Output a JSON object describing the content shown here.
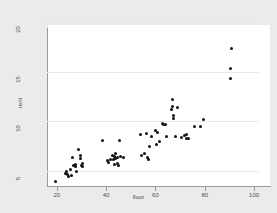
{
  "chart_data": {
    "type": "scatter",
    "title": "",
    "xlabel": "floor",
    "ylabel": "rent",
    "xlim": [
      12,
      102
    ],
    "ylim": [
      4.2,
      20.4
    ],
    "xticks": [
      20,
      40,
      60,
      80,
      100
    ],
    "yticks": [
      5,
      10,
      15,
      20
    ],
    "grid": "horizontal",
    "legend": "none",
    "marker": {
      "shape": "circle",
      "color": "#111111",
      "size": 3
    },
    "background": {
      "graph_region": "#ebebeb",
      "plot_region": "#ffffff"
    },
    "points": [
      {
        "x": 15,
        "y": 4.7
      },
      {
        "x": 19,
        "y": 5.5
      },
      {
        "x": 19.5,
        "y": 5.7
      },
      {
        "x": 20,
        "y": 5.4
      },
      {
        "x": 20.5,
        "y": 5.2
      },
      {
        "x": 21,
        "y": 5.9
      },
      {
        "x": 21.5,
        "y": 5.3
      },
      {
        "x": 22,
        "y": 7.1
      },
      {
        "x": 22.5,
        "y": 6.3
      },
      {
        "x": 23,
        "y": 6.4
      },
      {
        "x": 23.2,
        "y": 6.2
      },
      {
        "x": 23.5,
        "y": 5.7
      },
      {
        "x": 24.5,
        "y": 7.9
      },
      {
        "x": 25,
        "y": 7.3
      },
      {
        "x": 25.2,
        "y": 7.0
      },
      {
        "x": 25.5,
        "y": 6.3
      },
      {
        "x": 25.8,
        "y": 6.2
      },
      {
        "x": 26,
        "y": 6.5
      },
      {
        "x": 34,
        "y": 8.8
      },
      {
        "x": 36,
        "y": 6.8
      },
      {
        "x": 36.5,
        "y": 6.6
      },
      {
        "x": 37.5,
        "y": 6.9
      },
      {
        "x": 38,
        "y": 7.3
      },
      {
        "x": 38.5,
        "y": 6.9
      },
      {
        "x": 38.8,
        "y": 6.4
      },
      {
        "x": 39,
        "y": 7.2
      },
      {
        "x": 39.3,
        "y": 7.0
      },
      {
        "x": 39.5,
        "y": 7.5
      },
      {
        "x": 40,
        "y": 7.1
      },
      {
        "x": 40.2,
        "y": 6.5
      },
      {
        "x": 40.5,
        "y": 6.3
      },
      {
        "x": 41,
        "y": 8.8
      },
      {
        "x": 41.5,
        "y": 7.2
      },
      {
        "x": 42.5,
        "y": 7.1
      },
      {
        "x": 49.5,
        "y": 9.4
      },
      {
        "x": 50,
        "y": 7.3
      },
      {
        "x": 51,
        "y": 7.5
      },
      {
        "x": 52,
        "y": 9.5
      },
      {
        "x": 52.5,
        "y": 7.1
      },
      {
        "x": 52.8,
        "y": 6.9
      },
      {
        "x": 53,
        "y": 8.2
      },
      {
        "x": 54,
        "y": 9.2
      },
      {
        "x": 55.5,
        "y": 9.8
      },
      {
        "x": 56,
        "y": 8.4
      },
      {
        "x": 56.5,
        "y": 9.6
      },
      {
        "x": 57,
        "y": 8.7
      },
      {
        "x": 58.5,
        "y": 10.5
      },
      {
        "x": 59,
        "y": 10.4
      },
      {
        "x": 59.5,
        "y": 10.4
      },
      {
        "x": 60,
        "y": 9.2
      },
      {
        "x": 62,
        "y": 11.9
      },
      {
        "x": 62.3,
        "y": 12.2
      },
      {
        "x": 62.5,
        "y": 12.9
      },
      {
        "x": 62.8,
        "y": 11.0
      },
      {
        "x": 63,
        "y": 11.3
      },
      {
        "x": 63.5,
        "y": 9.2
      },
      {
        "x": 64.5,
        "y": 12.1
      },
      {
        "x": 66,
        "y": 9.1
      },
      {
        "x": 67.5,
        "y": 9.3
      },
      {
        "x": 68,
        "y": 9.4
      },
      {
        "x": 68.3,
        "y": 9.0
      },
      {
        "x": 69,
        "y": 9.0
      },
      {
        "x": 71.5,
        "y": 10.2
      },
      {
        "x": 74,
        "y": 10.2
      },
      {
        "x": 75,
        "y": 10.9
      },
      {
        "x": 86,
        "y": 15.0
      },
      {
        "x": 86,
        "y": 16.0
      },
      {
        "x": 86.2,
        "y": 18.0
      }
    ]
  }
}
